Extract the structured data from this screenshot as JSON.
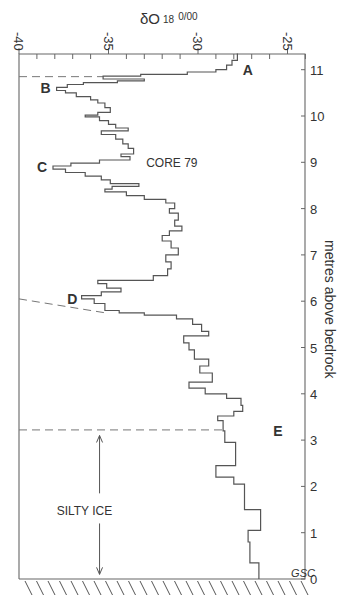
{
  "chart_data": {
    "type": "line",
    "title": "CORE 79",
    "xlabel": "δO18 ‰",
    "xlabel_main": "δO",
    "xlabel_sup": "18",
    "xlabel_unit": "0/00",
    "ylabel": "metres above bedrock",
    "xlim": [
      -40,
      -24
    ],
    "ylim": [
      0,
      11.35
    ],
    "x_ticks": [
      "-40",
      "-35",
      "-30",
      "-25"
    ],
    "x_tick_values": [
      -40,
      -35,
      -30,
      -25
    ],
    "y_ticks": [
      "0",
      "1",
      "2",
      "3",
      "4",
      "5",
      "6",
      "7",
      "8",
      "9",
      "10",
      "11"
    ],
    "y_tick_values": [
      0,
      1,
      2,
      3,
      4,
      5,
      6,
      7,
      8,
      9,
      10,
      11
    ],
    "grid": false,
    "series": [
      {
        "name": "Core 79 δ18O profile",
        "style": "step",
        "points": [
          [
            -27.8,
            11.35
          ],
          [
            -27.8,
            11.2
          ],
          [
            -28.1,
            11.2
          ],
          [
            -28.1,
            11.1
          ],
          [
            -28.4,
            11.1
          ],
          [
            -28.4,
            11.0
          ],
          [
            -29.0,
            11.0
          ],
          [
            -29.0,
            10.95
          ],
          [
            -30.6,
            10.95
          ],
          [
            -30.6,
            10.9
          ],
          [
            -33.2,
            10.9
          ],
          [
            -33.2,
            10.86
          ],
          [
            -35.3,
            10.86
          ],
          [
            -35.3,
            10.8
          ],
          [
            -33.0,
            10.8
          ],
          [
            -33.0,
            10.76
          ],
          [
            -34.5,
            10.76
          ],
          [
            -34.5,
            10.72
          ],
          [
            -36.4,
            10.72
          ],
          [
            -36.4,
            10.68
          ],
          [
            -37.3,
            10.68
          ],
          [
            -37.3,
            10.62
          ],
          [
            -37.9,
            10.62
          ],
          [
            -37.9,
            10.55
          ],
          [
            -37.4,
            10.55
          ],
          [
            -37.4,
            10.5
          ],
          [
            -36.8,
            10.5
          ],
          [
            -36.8,
            10.42
          ],
          [
            -36.0,
            10.42
          ],
          [
            -36.0,
            10.35
          ],
          [
            -35.6,
            10.35
          ],
          [
            -35.6,
            10.28
          ],
          [
            -35.2,
            10.28
          ],
          [
            -35.2,
            10.18
          ],
          [
            -34.9,
            10.18
          ],
          [
            -34.9,
            10.08
          ],
          [
            -35.6,
            10.08
          ],
          [
            -35.6,
            10.02
          ],
          [
            -36.3,
            10.02
          ],
          [
            -36.3,
            9.98
          ],
          [
            -35.5,
            9.98
          ],
          [
            -35.5,
            9.9
          ],
          [
            -35.0,
            9.9
          ],
          [
            -35.0,
            9.82
          ],
          [
            -34.6,
            9.82
          ],
          [
            -34.6,
            9.74
          ],
          [
            -33.9,
            9.74
          ],
          [
            -33.9,
            9.68
          ],
          [
            -35.4,
            9.68
          ],
          [
            -35.4,
            9.6
          ],
          [
            -34.6,
            9.6
          ],
          [
            -34.6,
            9.5
          ],
          [
            -34.2,
            9.5
          ],
          [
            -34.2,
            9.4
          ],
          [
            -33.9,
            9.4
          ],
          [
            -33.9,
            9.3
          ],
          [
            -33.6,
            9.3
          ],
          [
            -33.6,
            9.18
          ],
          [
            -34.3,
            9.18
          ],
          [
            -34.3,
            9.12
          ],
          [
            -33.8,
            9.12
          ],
          [
            -33.8,
            9.05
          ],
          [
            -35.5,
            9.05
          ],
          [
            -35.5,
            8.98
          ],
          [
            -37.1,
            8.98
          ],
          [
            -37.1,
            8.92
          ],
          [
            -38.1,
            8.92
          ],
          [
            -38.1,
            8.85
          ],
          [
            -37.4,
            8.85
          ],
          [
            -37.4,
            8.78
          ],
          [
            -36.3,
            8.78
          ],
          [
            -36.3,
            8.7
          ],
          [
            -35.4,
            8.7
          ],
          [
            -35.4,
            8.62
          ],
          [
            -34.9,
            8.62
          ],
          [
            -34.9,
            8.54
          ],
          [
            -33.3,
            8.54
          ],
          [
            -33.3,
            8.48
          ],
          [
            -34.8,
            8.48
          ],
          [
            -34.8,
            8.42
          ],
          [
            -35.2,
            8.42
          ],
          [
            -35.2,
            8.36
          ],
          [
            -34.0,
            8.36
          ],
          [
            -34.0,
            8.28
          ],
          [
            -33.0,
            8.28
          ],
          [
            -33.0,
            8.2
          ],
          [
            -31.8,
            8.2
          ],
          [
            -31.8,
            8.12
          ],
          [
            -31.3,
            8.12
          ],
          [
            -31.3,
            8.0
          ],
          [
            -31.6,
            8.0
          ],
          [
            -31.6,
            7.9
          ],
          [
            -31.1,
            7.9
          ],
          [
            -31.1,
            7.75
          ],
          [
            -31.3,
            7.75
          ],
          [
            -31.3,
            7.62
          ],
          [
            -30.9,
            7.62
          ],
          [
            -30.9,
            7.52
          ],
          [
            -31.6,
            7.52
          ],
          [
            -31.6,
            7.42
          ],
          [
            -32.0,
            7.42
          ],
          [
            -32.0,
            7.3
          ],
          [
            -31.5,
            7.3
          ],
          [
            -31.5,
            7.15
          ],
          [
            -31.1,
            7.15
          ],
          [
            -31.1,
            7.0
          ],
          [
            -31.8,
            7.0
          ],
          [
            -31.8,
            6.85
          ],
          [
            -31.5,
            6.85
          ],
          [
            -31.5,
            6.7
          ],
          [
            -31.7,
            6.7
          ],
          [
            -31.7,
            6.55
          ],
          [
            -32.5,
            6.55
          ],
          [
            -32.5,
            6.45
          ],
          [
            -35.6,
            6.45
          ],
          [
            -35.6,
            6.38
          ],
          [
            -35.1,
            6.38
          ],
          [
            -35.1,
            6.28
          ],
          [
            -34.3,
            6.28
          ],
          [
            -34.3,
            6.2
          ],
          [
            -35.4,
            6.2
          ],
          [
            -35.4,
            6.12
          ],
          [
            -36.5,
            6.12
          ],
          [
            -36.5,
            6.05
          ],
          [
            -35.8,
            6.05
          ],
          [
            -35.8,
            5.95
          ],
          [
            -35.2,
            5.95
          ],
          [
            -35.2,
            5.8
          ],
          [
            -34.4,
            5.8
          ],
          [
            -34.4,
            5.75
          ],
          [
            -33.0,
            5.75
          ],
          [
            -33.0,
            5.7
          ],
          [
            -31.2,
            5.7
          ],
          [
            -31.2,
            5.62
          ],
          [
            -30.3,
            5.62
          ],
          [
            -30.3,
            5.5
          ],
          [
            -29.8,
            5.5
          ],
          [
            -29.8,
            5.35
          ],
          [
            -29.4,
            5.35
          ],
          [
            -29.4,
            5.25
          ],
          [
            -30.8,
            5.25
          ],
          [
            -30.8,
            5.1
          ],
          [
            -30.5,
            5.1
          ],
          [
            -30.5,
            4.95
          ],
          [
            -30.2,
            4.95
          ],
          [
            -30.2,
            4.75
          ],
          [
            -29.4,
            4.75
          ],
          [
            -29.4,
            4.6
          ],
          [
            -29.9,
            4.6
          ],
          [
            -29.9,
            4.45
          ],
          [
            -29.2,
            4.45
          ],
          [
            -29.2,
            4.25
          ],
          [
            -30.5,
            4.25
          ],
          [
            -30.5,
            4.12
          ],
          [
            -29.6,
            4.12
          ],
          [
            -29.6,
            4.0
          ],
          [
            -28.4,
            4.0
          ],
          [
            -28.4,
            3.9
          ],
          [
            -27.6,
            3.9
          ],
          [
            -27.6,
            3.75
          ],
          [
            -27.5,
            3.75
          ],
          [
            -27.5,
            3.62
          ],
          [
            -28.0,
            3.62
          ],
          [
            -28.0,
            3.52
          ],
          [
            -28.9,
            3.52
          ],
          [
            -28.9,
            3.42
          ],
          [
            -28.6,
            3.42
          ],
          [
            -28.6,
            3.2
          ],
          [
            -28.5,
            3.2
          ],
          [
            -28.5,
            2.95
          ],
          [
            -27.9,
            2.95
          ],
          [
            -27.9,
            2.45
          ],
          [
            -29.0,
            2.45
          ],
          [
            -29.0,
            2.2
          ],
          [
            -28.0,
            2.2
          ],
          [
            -28.0,
            2.05
          ],
          [
            -27.4,
            2.05
          ],
          [
            -27.4,
            1.5
          ],
          [
            -26.5,
            1.5
          ],
          [
            -26.5,
            1.05
          ],
          [
            -27.2,
            1.05
          ],
          [
            -27.2,
            0.8
          ],
          [
            -27.1,
            0.8
          ],
          [
            -27.1,
            0.35
          ],
          [
            -26.6,
            0.35
          ],
          [
            -26.6,
            0.0
          ]
        ]
      }
    ],
    "annotations": [
      {
        "text": "A",
        "x": -27.5,
        "y": 11.0
      },
      {
        "text": "B",
        "x": -38.8,
        "y": 10.6
      },
      {
        "text": "C",
        "x": -39.0,
        "y": 8.9
      },
      {
        "text": "D",
        "x": -37.3,
        "y": 6.05
      },
      {
        "text": "E",
        "x": -25.8,
        "y": 3.2
      },
      {
        "text": "CORE 79",
        "x": -31.5,
        "y": 9.0
      },
      {
        "text": "SILTY ICE",
        "x": -36.5,
        "y": 1.5
      },
      {
        "text": "GSC",
        "x": -24.8,
        "y": 0.15
      }
    ],
    "dashed_lines": [
      {
        "from": [
          -40,
          10.85
        ],
        "to": [
          -35.3,
          10.85
        ]
      },
      {
        "from": [
          -40,
          6.05
        ],
        "to": [
          -35.2,
          5.75
        ]
      },
      {
        "from": [
          -40,
          3.22
        ],
        "to": [
          -28.6,
          3.22
        ]
      }
    ],
    "silty_ice_arrow": {
      "from_m": 3.1,
      "to_m": 0.1,
      "x": -35.5
    }
  }
}
